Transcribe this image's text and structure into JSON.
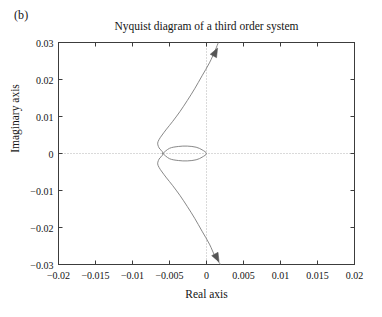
{
  "figure": {
    "panel_label": "(b)",
    "background": "#ffffff"
  },
  "chart_data": {
    "type": "line",
    "title": "Nyquist diagram of a third order system",
    "xlabel": "Real axis",
    "ylabel": "Imaginary axis",
    "xlim": [
      -0.02,
      0.02
    ],
    "ylim": [
      -0.03,
      0.03
    ],
    "grid": false,
    "zero_lines": {
      "style": "dotted",
      "color": "#b4b4b4",
      "x": 0,
      "y": 0
    },
    "legend": null,
    "curve_color": "#7a7a7a",
    "axis_color": "#3c3c3c",
    "xticks": [
      -0.02,
      -0.015,
      -0.01,
      -0.005,
      0,
      0.005,
      0.01,
      0.015,
      0.02
    ],
    "xticklabels": [
      "−0.02",
      "−0.015",
      "−0.01",
      "−0.005",
      "0",
      "0.005",
      "0.01",
      "0.015",
      "0.02"
    ],
    "yticks": [
      0.03,
      0.02,
      0.01,
      0,
      -0.01,
      -0.02,
      -0.03
    ],
    "yticklabels": [
      "0.03",
      "0.02",
      "0.01",
      "0",
      "−0.01",
      "−0.02",
      "−0.03"
    ],
    "series": [
      {
        "name": "Nyquist contour (upper branch)",
        "comment": "Sweeps from upper right down and left into the cusp near the origin",
        "points": [
          [
            0.0016,
            0.03
          ],
          [
            0.0012,
            0.028
          ],
          [
            0.0004,
            0.0245
          ],
          [
            -0.0006,
            0.021
          ],
          [
            -0.0016,
            0.0175
          ],
          [
            -0.0026,
            0.0143
          ],
          [
            -0.0036,
            0.0113
          ],
          [
            -0.0046,
            0.0086
          ],
          [
            -0.0054,
            0.0066
          ],
          [
            -0.006,
            0.005
          ],
          [
            -0.0064,
            0.0038
          ],
          [
            -0.0066,
            0.0028
          ],
          [
            -0.0065,
            0.0019
          ],
          [
            -0.0063,
            0.0012
          ],
          [
            -0.006,
            0.0006
          ],
          [
            -0.0059,
            0.0
          ]
        ]
      },
      {
        "name": "Nyquist contour (lower branch)",
        "comment": "Mirror image of the upper branch below the real axis",
        "points": [
          [
            -0.0059,
            0.0
          ],
          [
            -0.006,
            -0.0006
          ],
          [
            -0.0063,
            -0.0012
          ],
          [
            -0.0065,
            -0.0019
          ],
          [
            -0.0066,
            -0.0028
          ],
          [
            -0.0064,
            -0.0038
          ],
          [
            -0.006,
            -0.005
          ],
          [
            -0.0054,
            -0.0066
          ],
          [
            -0.0046,
            -0.0086
          ],
          [
            -0.0036,
            -0.0113
          ],
          [
            -0.0026,
            -0.0143
          ],
          [
            -0.0016,
            -0.0175
          ],
          [
            -0.0006,
            -0.021
          ],
          [
            0.0004,
            -0.0245
          ],
          [
            0.0012,
            -0.028
          ],
          [
            0.0019,
            -0.03
          ]
        ]
      },
      {
        "name": "Inner loop",
        "comment": "Small lens-shaped closed loop from the cusp to the origin",
        "points": [
          [
            -0.0059,
            0.0
          ],
          [
            -0.005,
            0.0014
          ],
          [
            -0.0038,
            0.0019
          ],
          [
            -0.0026,
            0.002
          ],
          [
            -0.0014,
            0.0017
          ],
          [
            -0.0006,
            0.001
          ],
          [
            0.0,
            0.0
          ],
          [
            -0.0006,
            -0.001
          ],
          [
            -0.0014,
            -0.0017
          ],
          [
            -0.0026,
            -0.002
          ],
          [
            -0.0038,
            -0.0019
          ],
          [
            -0.005,
            -0.0014
          ],
          [
            -0.0059,
            0.0
          ]
        ]
      }
    ],
    "arrows": [
      {
        "name": "upper-direction-arrow",
        "x": 0.0015,
        "y": 0.0285,
        "direction": "up-right"
      },
      {
        "name": "lower-direction-arrow",
        "x": 0.0017,
        "y": -0.0293,
        "direction": "down-right"
      }
    ]
  }
}
